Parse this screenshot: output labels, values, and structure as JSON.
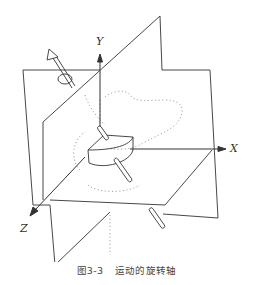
{
  "figure": {
    "type": "3d-rotation-axis-diagram",
    "axes": {
      "x_label": "X",
      "y_label": "Y",
      "z_label": "Z"
    },
    "elements": [
      "vertical-plane-back",
      "vertical-plane-front",
      "horizontal-plane",
      "rotation-axis-arrow",
      "rotation-circle",
      "half-cylinder-object",
      "dotted-object-outline"
    ],
    "colors": {
      "line": "#333333",
      "dotted": "#9a9a9a",
      "background": "#ffffff"
    }
  },
  "caption": {
    "number": "图3-3",
    "title": "运动的旋转轴"
  }
}
